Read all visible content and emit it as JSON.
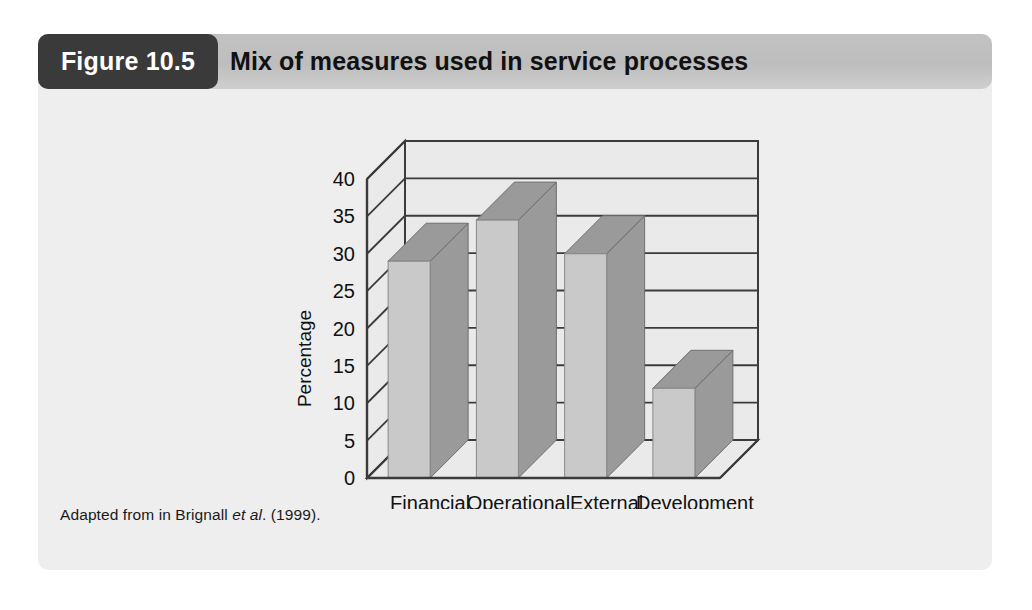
{
  "figure": {
    "badge_label": "Figure 10.5",
    "title": "Mix of measures used in service processes",
    "caption_prefix": "Adapted from in Brignall ",
    "caption_italic": "et al",
    "caption_suffix": ". (1999)."
  },
  "colors": {
    "badge_bg": "#3a3a3a",
    "header_bg": "#c2c2c2",
    "card_bg": "#eeeeee",
    "bar_front": "#c9c9c9",
    "bar_top": "#9a9a9a",
    "bar_side": "#9a9a9a",
    "axis_line": "#3b3b3b",
    "wall_bg": "#eaeaea"
  },
  "chart_data": {
    "type": "bar",
    "title": "Mix of measures used in service processes",
    "xlabel": "",
    "ylabel": "Percentage",
    "categories": [
      "Financial",
      "Operational",
      "External",
      "Development"
    ],
    "values": [
      29,
      34.5,
      30,
      12
    ],
    "ylim": [
      0,
      40
    ],
    "yticks": [
      0,
      5,
      10,
      15,
      20,
      25,
      30,
      35,
      40
    ],
    "ytick_labels": [
      "0",
      "5",
      "10",
      "15",
      "20",
      "25",
      "30",
      "35",
      "40"
    ],
    "grid": true,
    "legend": "none",
    "style": "3d-column",
    "source_note": "Adapted from in Brignall et al. (1999)."
  }
}
